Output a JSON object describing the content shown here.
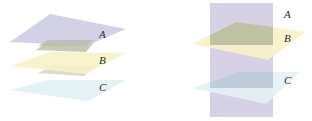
{
  "figure": {
    "left_panel": {
      "description": "Three parallel planes",
      "planes": [
        {
          "label": "A",
          "color": "#cfcde3"
        },
        {
          "label": "B",
          "color": "#f7f1c8"
        },
        {
          "label": "C",
          "color": "#e3f1f5"
        }
      ]
    },
    "right_panel": {
      "description": "Vertical plane A intersected by parallel planes B and C",
      "planes": [
        {
          "label": "A",
          "color": "#d4cfe4"
        },
        {
          "label": "B",
          "color": "#f7f1c8"
        },
        {
          "label": "C",
          "color": "#e3f1f5"
        }
      ]
    },
    "overlap_colors": {
      "A_B": "#b9bd9e",
      "A_C": "#b9c6d4"
    }
  }
}
